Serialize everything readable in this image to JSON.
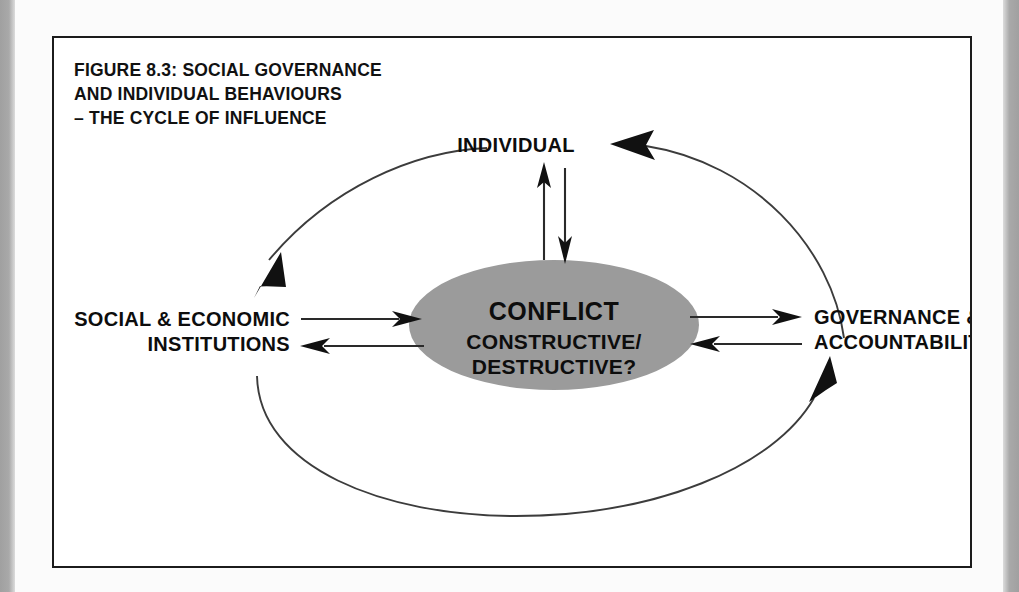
{
  "figure": {
    "title_lines": [
      "FIGURE 8.3:  SOCIAL GOVERNANCE",
      "AND INDIVIDUAL BEHAVIOURS",
      "– THE CYCLE OF INFLUENCE"
    ],
    "caption_number": "8.3"
  },
  "nodes": {
    "top": {
      "label": "INDIVIDUAL"
    },
    "left": {
      "line1": "SOCIAL & ECONOMIC",
      "line2": "INSTITUTIONS"
    },
    "right": {
      "line1": "GOVERNANCE &",
      "line2": "ACCOUNTABILITY"
    },
    "center": {
      "title": "CONFLICT",
      "sub1": "CONSTRUCTIVE/",
      "sub2": "DESTRUCTIVE?"
    }
  },
  "colors": {
    "core_fill": "#9b9b9b",
    "stroke": "#2a2a2a",
    "curve": "#3c3c3c",
    "frame": "#1b1b1b",
    "page": "#ffffff",
    "margin_gray": "#a4a4a4"
  },
  "icons": {
    "cycle_arrow": "cycle-arrow-icon",
    "flow_arrow": "flow-arrow-icon"
  }
}
